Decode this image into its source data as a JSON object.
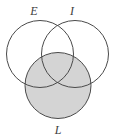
{
  "figure": {
    "type": "venn-diagram",
    "sets": 3,
    "background_color": "#ffffff",
    "stroke_color": "#4a4a4a",
    "stroke_width": 1,
    "shade_color": "#d4d4d4",
    "width": 117,
    "height": 139
  },
  "circles": [
    {
      "id": "E",
      "label": "E",
      "cx": 40,
      "cy": 54,
      "r": 33.5,
      "filled": false
    },
    {
      "id": "I",
      "label": "I",
      "cx": 75,
      "cy": 54,
      "r": 33.5,
      "filled": false
    },
    {
      "id": "L",
      "label": "L",
      "cx": 58,
      "cy": 85.5,
      "r": 33,
      "filled": true
    }
  ],
  "labels": {
    "e": {
      "text": "E",
      "x": 34,
      "y": 15
    },
    "i": {
      "text": "I",
      "x": 72,
      "y": 15
    },
    "l": {
      "text": "L",
      "x": 58,
      "y": 134
    }
  },
  "shaded_region": {
    "description": "L",
    "color": "#d4d4d4"
  }
}
